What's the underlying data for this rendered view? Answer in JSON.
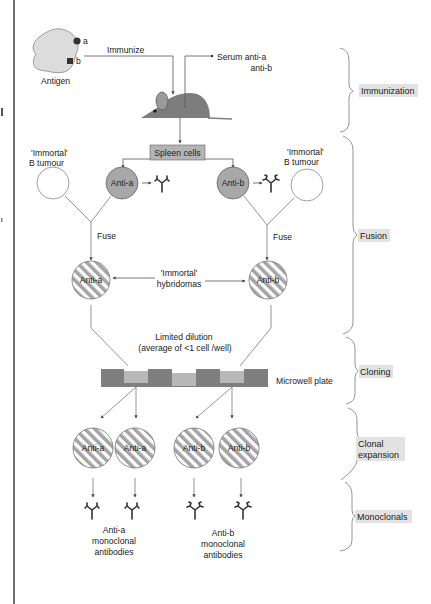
{
  "colors": {
    "antigen_fill": "#dcdcdc",
    "mouse_fill": "#7d7d7d",
    "spleen_box_fill": "#b4b4b4",
    "b_cell_fill": "#a8a8a8",
    "hybridoma_stripe_dark": "#a4a4a4",
    "hybridoma_stripe_light": "#ffffff",
    "plate_fill": "#7f7f7f",
    "well_fill": "#b8b8b8",
    "stage_label_bg": "#e2e2e2"
  },
  "antigen": {
    "label": "Antigen",
    "epitope_a": "a",
    "epitope_b": "b"
  },
  "immunization": {
    "immunize_label": "Immunize",
    "serum_line1": "Serum anti-a",
    "serum_line2": "anti-b"
  },
  "spleen": {
    "label": "Spleen cells"
  },
  "fusion": {
    "tumour_left_line1": "'Immortal'",
    "tumour_left_line2": "B tumour",
    "tumour_right_line1": "'Immortal'",
    "tumour_right_line2": "B tumour",
    "b_cell_a": "Anti-a",
    "b_cell_b": "Anti-b",
    "fuse_left": "Fuse",
    "fuse_right": "Fuse",
    "hybridoma_a": "Anti-a",
    "hybridoma_b": "Anti-b",
    "hybridomas_line1": "'Immortal'",
    "hybridomas_line2": "hybridomas"
  },
  "cloning": {
    "dilution_line1": "Limited dilution",
    "dilution_line2": "(average of <1 cell /well)",
    "plate_label": "Microwell plate"
  },
  "expansion": {
    "clones": [
      "Anti-a",
      "Anti-a",
      "Anti-b",
      "Anti-b"
    ]
  },
  "monoclonals": {
    "group_a": [
      "Anti-a",
      "monoclonal",
      "antibodies"
    ],
    "group_b": [
      "Anti-b",
      "monoclonal",
      "antibodies"
    ]
  },
  "stages": {
    "immunization": [
      "Immunization"
    ],
    "fusion": [
      "Fusion"
    ],
    "cloning": [
      "Cloning"
    ],
    "clonal_expansion": [
      "Clonal",
      "expansion"
    ],
    "monoclonals": [
      "Monoclonals"
    ]
  }
}
